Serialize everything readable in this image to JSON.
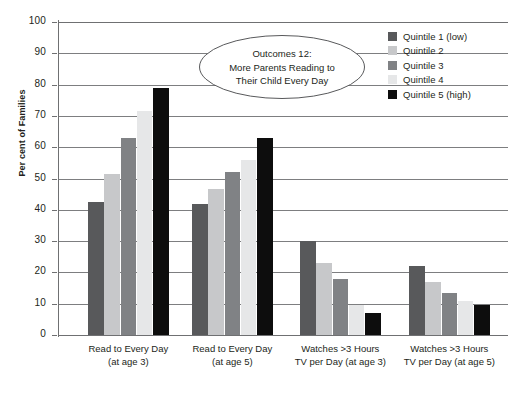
{
  "chart_data": {
    "type": "bar",
    "title": "",
    "xlabel": "",
    "ylabel": "Per cent of Families",
    "ylim": [
      0,
      100
    ],
    "ytick_step": 10,
    "grid": true,
    "legend_position": "right",
    "categories": [
      "Read to Every Day (at age 3)",
      "Read to Every Day (at age 5)",
      "Watches >3 Hours TV per Day (at age 3)",
      "Watches >3 Hours TV per Day (at age 5)"
    ],
    "category_lines": [
      [
        "Read to Every Day",
        "(at age 3)"
      ],
      [
        "Read to Every Day",
        "(at age 5)"
      ],
      [
        "Watches >3 Hours",
        "TV per Day (at age 3)"
      ],
      [
        "Watches >3 Hours",
        "TV per Day (at age 5)"
      ]
    ],
    "ytick_labels": [
      "100",
      "90",
      "80",
      "70",
      "60",
      "50",
      "40",
      "30",
      "20",
      "10",
      "0"
    ],
    "series": [
      {
        "name": "Quintile 1 (low)",
        "color": "#58595b",
        "values": [
          42.5,
          42.0,
          30.0,
          22.0
        ]
      },
      {
        "name": "Quintile 2",
        "color": "#c7c8ca",
        "values": [
          51.5,
          46.5,
          23.0,
          17.0
        ]
      },
      {
        "name": "Quintile 3",
        "color": "#808285",
        "values": [
          63.0,
          52.0,
          18.0,
          13.5
        ]
      },
      {
        "name": "Quintile 4",
        "color": "#e6e7e8",
        "values": [
          71.5,
          56.0,
          9.5,
          11.0
        ]
      },
      {
        "name": "Quintile 5 (high)",
        "color": "#0d0d0d",
        "values": [
          79.0,
          63.0,
          7.0,
          9.5
        ]
      }
    ]
  },
  "callout": {
    "lines": [
      "Outcomes 12:",
      "More Parents Reading to",
      "Their Child Every Day"
    ]
  },
  "legend": {
    "items": [
      {
        "label": "Quintile 1 (low)",
        "color": "#58595b"
      },
      {
        "label": "Quintile 2",
        "color": "#c7c8ca"
      },
      {
        "label": "Quintile 3",
        "color": "#808285"
      },
      {
        "label": "Quintile 4",
        "color": "#e6e7e8"
      },
      {
        "label": "Quintile 5 (high)",
        "color": "#0d0d0d"
      }
    ]
  },
  "colors": {
    "axis": "#6f7072",
    "gridline": "#7d7e80",
    "text": "#231f20",
    "background": "#ffffff"
  }
}
